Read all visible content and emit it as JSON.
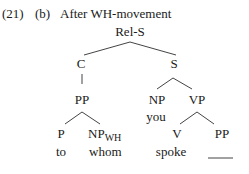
{
  "example": {
    "number": "(21)",
    "sub_label": "(b)",
    "title": "After WH-movement"
  },
  "tree": {
    "root": "Rel-S",
    "c_node": "C",
    "s_node": "S",
    "pp_node": "PP",
    "np_node": "NP",
    "vp_node": "VP",
    "np_leaf": "you",
    "p_node": "P",
    "npwh_node": "NP",
    "npwh_sub": "WH",
    "v_node": "V",
    "pp2_node": "PP",
    "p_leaf": "to",
    "npwh_leaf": "whom",
    "v_leaf": "spoke",
    "pp2_leaf": "gap"
  },
  "colors": {
    "text": "#1a1a1a",
    "line": "#444444"
  }
}
